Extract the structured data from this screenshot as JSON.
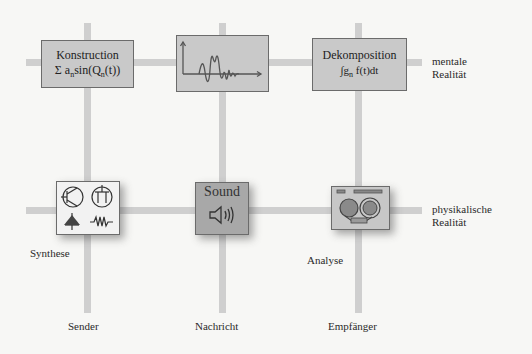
{
  "diagram": {
    "columns": [
      {
        "id": "sender",
        "label": "Sender"
      },
      {
        "id": "nachricht",
        "label": "Nachricht"
      },
      {
        "id": "empfaenger",
        "label": "Empfänger"
      }
    ],
    "rows": [
      {
        "id": "mental",
        "label_line1": "mentale",
        "label_line2": "Realität"
      },
      {
        "id": "physical",
        "label_line1": "physikalische",
        "label_line2": "Realität"
      }
    ],
    "boxes": {
      "konstruction": {
        "title": "Konstruction",
        "formula_prefix": "Σ a",
        "formula_sub": "n",
        "formula_mid": "sin(Q",
        "formula_sub2": "n",
        "formula_suffix": "(t))"
      },
      "signal": {
        "icon": "waveform-plot-icon"
      },
      "dekomposition": {
        "title": "Dekomposition",
        "formula_prefix": "∫g",
        "formula_sub": "n",
        "formula_suffix": " f(t)dt"
      },
      "synthese": {
        "icon": "circuit-symbols-icon",
        "caption": "Synthese"
      },
      "sound": {
        "title": "Sound",
        "icon": "speaker-icon"
      },
      "analyse": {
        "icon": "tape-recorder-icon",
        "caption": "Analyse"
      }
    },
    "colors": {
      "grid_line": "#cfcfcf",
      "box_fill": "#c9c9c9",
      "sound_fill": "#a8a8a8",
      "box_border": "#6b6b6b",
      "background": "#f7f7f5"
    }
  }
}
